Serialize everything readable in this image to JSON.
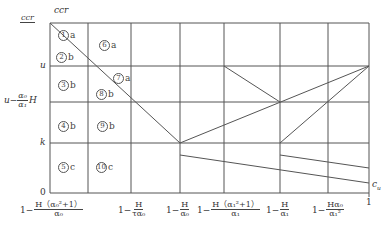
{
  "diagram": {
    "title_top_label": "ccr",
    "y_axis": {
      "top_fraction": {
        "num": "ccr",
        "den": "ccr"
      },
      "labels": [
        {
          "id": "u",
          "text": "u",
          "y": 66
        },
        {
          "id": "u-alpha-h",
          "pre": "u−",
          "num": "α₀",
          "den": "α₁",
          "post": "H",
          "y": 102
        },
        {
          "id": "k",
          "text": "k",
          "y": 143
        },
        {
          "id": "zero",
          "text": "0",
          "y": 193
        }
      ]
    },
    "x_axis": {
      "end_label": "c_u",
      "labels": [
        {
          "pre": "1−",
          "num": "H（α₀²+1）",
          "den": "α₀",
          "x": 50
        },
        {
          "pre": "1−",
          "num": "H",
          "den": "τα₀",
          "x": 131
        },
        {
          "pre": "1−",
          "num": "H",
          "den": "α₀",
          "x": 180
        },
        {
          "pre": "1−",
          "num": "H（α₁²+1）",
          "den": "α₁",
          "x": 224
        },
        {
          "pre": "1−",
          "num": "H",
          "den": "α₁",
          "x": 280
        },
        {
          "pre": "1−",
          "num": "Hα₀",
          "den": "α₁²",
          "x": 328
        },
        {
          "text": "1",
          "x": 369
        }
      ]
    },
    "regions": [
      {
        "num": "1",
        "suffix": "a",
        "x": 58,
        "y": 30
      },
      {
        "num": "2",
        "suffix": "b",
        "x": 56,
        "y": 52
      },
      {
        "num": "3",
        "suffix": "b",
        "x": 58,
        "y": 80
      },
      {
        "num": "4",
        "suffix": "b",
        "x": 58,
        "y": 121
      },
      {
        "num": "5",
        "suffix": "c",
        "x": 58,
        "y": 162
      },
      {
        "num": "6",
        "suffix": "a",
        "x": 99,
        "y": 40
      },
      {
        "num": "7",
        "suffix": "a",
        "x": 113,
        "y": 73
      },
      {
        "num": "8",
        "suffix": "b",
        "x": 96,
        "y": 89
      },
      {
        "num": "9",
        "suffix": "b",
        "x": 97,
        "y": 121
      },
      {
        "num": "10",
        "suffix": "c",
        "x": 96,
        "y": 162
      }
    ],
    "grid": {
      "x_lines": [
        50,
        88,
        131,
        180,
        224,
        280,
        328,
        369
      ],
      "y_lines": [
        23,
        66,
        102,
        143,
        193
      ],
      "stroke": "#555555"
    },
    "curves": [
      {
        "name": "descending-boundary",
        "points": [
          [
            50,
            23
          ],
          [
            180,
            143
          ]
        ]
      },
      {
        "name": "rising-line-1",
        "points": [
          [
            180,
            143
          ],
          [
            369,
            66
          ]
        ]
      },
      {
        "name": "rising-line-2",
        "points": [
          [
            280,
            143
          ],
          [
            369,
            66
          ]
        ]
      },
      {
        "name": "diag-u-to-mid",
        "points": [
          [
            224,
            66
          ],
          [
            280,
            102
          ]
        ]
      },
      {
        "name": "lower-line-1",
        "points": [
          [
            180,
            155
          ],
          [
            369,
            183
          ]
        ]
      },
      {
        "name": "lower-line-2",
        "points": [
          [
            280,
            155
          ],
          [
            369,
            168
          ]
        ]
      }
    ]
  }
}
